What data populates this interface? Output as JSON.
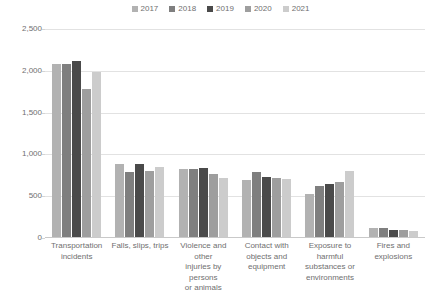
{
  "chart_data": {
    "type": "bar",
    "title": "",
    "xlabel": "",
    "ylabel": "",
    "ylim": [
      0,
      2500
    ],
    "yticks": [
      "0",
      "500",
      "1,000",
      "1,500",
      "2,000",
      "2,500"
    ],
    "grid": true,
    "legend_position": "top-center",
    "categories": [
      "Transportation incidents",
      "Falls, slips, trips",
      "Violence and other injuries by persons or animals",
      "Contact with objects and equipment",
      "Exposure to harmful substances or environments",
      "Fires and explosions"
    ],
    "series": [
      {
        "name": "2017",
        "color": "#b2b2b2",
        "values": [
          2077,
          887,
          829,
          695,
          531,
          123
        ]
      },
      {
        "name": "2018",
        "color": "#7f7f7f",
        "values": [
          2080,
          791,
          828,
          786,
          621,
          115
        ]
      },
      {
        "name": "2019",
        "color": "#4a4a4a",
        "values": [
          2122,
          880,
          841,
          732,
          642,
          99
        ]
      },
      {
        "name": "2020",
        "color": "#9e9e9e",
        "values": [
          1778,
          805,
          767,
          716,
          672,
          95
        ]
      },
      {
        "name": "2021",
        "color": "#cccccc",
        "values": [
          1982,
          850,
          718,
          705,
          798,
          79
        ]
      }
    ]
  },
  "axis": {
    "category_lines": [
      [
        "Transportation",
        "incidents"
      ],
      [
        "Falls, slips, trips"
      ],
      [
        "Violence and other",
        "injuries by persons",
        "or animals"
      ],
      [
        "Contact with",
        "objects and",
        "equipment"
      ],
      [
        "Exposure to",
        "harmful",
        "substances or",
        "environments"
      ],
      [
        "Fires and",
        "explosions"
      ]
    ]
  }
}
